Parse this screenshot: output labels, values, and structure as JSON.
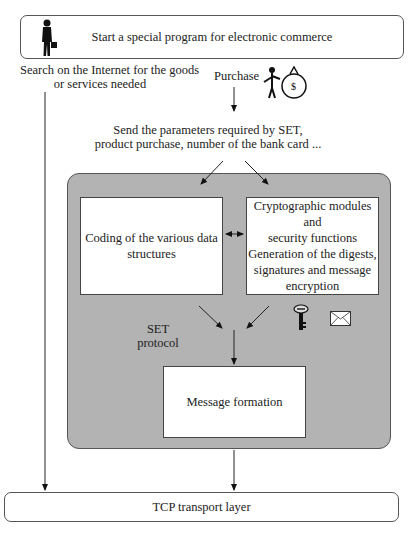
{
  "top_box": {
    "label": "Start a special program for electronic commerce",
    "icon": "businessman-icon"
  },
  "search_text": {
    "line1": "Search on the Internet for the goods",
    "line2": "or services needed"
  },
  "purchase": {
    "label": "Purchase",
    "icon": "person-with-money-bag-icon"
  },
  "send_params": {
    "line1": "Send the parameters required by SET,",
    "line2": "product purchase, number of the bank card ..."
  },
  "set_protocol": {
    "label_line1": "SET",
    "label_line2": "protocol",
    "fill_color": "#b3b3b3",
    "coding_box": {
      "line1": "Coding of the various data",
      "line2": "structures"
    },
    "crypto_box": {
      "line1": "Cryptographic modules and",
      "line2": "security functions",
      "line3": "Generation of the digests,",
      "line4": "signatures and message",
      "line5": "encryption"
    },
    "icons": [
      "key-icon",
      "envelope-icon"
    ],
    "message_box": {
      "label": "Message formation"
    }
  },
  "bottom_box": {
    "label": "TCP transport layer"
  }
}
